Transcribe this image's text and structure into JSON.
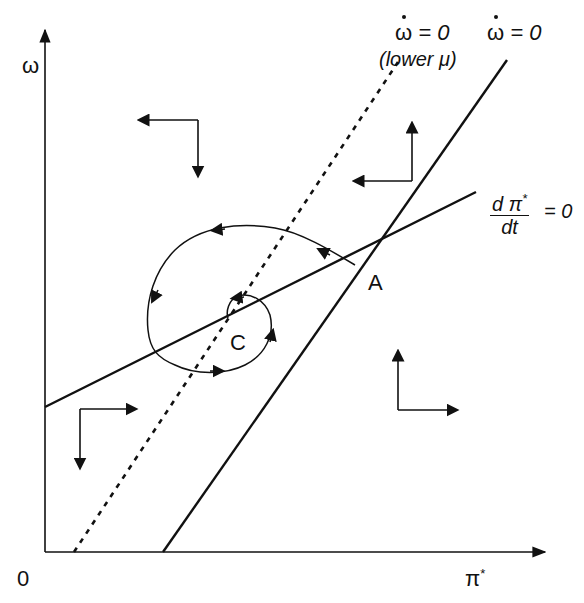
{
  "diagram": {
    "type": "phase-diagram",
    "axes": {
      "y_label": "ω",
      "x_label": "π",
      "x_label_sup": "*",
      "origin_label": "0"
    },
    "curves": {
      "omega_dot_zero": {
        "label_symbol": "ω",
        "label_rest": " = 0",
        "style": "solid"
      },
      "omega_dot_zero_lower_mu": {
        "label_symbol": "ω",
        "label_rest": " = 0",
        "sublabel": "(lower μ)",
        "style": "dashed"
      },
      "dpi_dt_zero": {
        "numerator": "d π",
        "numerator_sup": "*",
        "denominator": "dt",
        "rest": "= 0",
        "style": "solid"
      }
    },
    "points": {
      "A": "A",
      "C": "C"
    },
    "direction_arrows": [
      {
        "region": "upper-left",
        "horizontal": "left",
        "vertical": "down"
      },
      {
        "region": "upper-right",
        "horizontal": "left",
        "vertical": "up"
      },
      {
        "region": "lower-left",
        "horizontal": "right",
        "vertical": "down"
      },
      {
        "region": "lower-right",
        "horizontal": "right",
        "vertical": "up"
      }
    ],
    "trajectory": "spiral from A counter-clockwise converging to C",
    "colors": {
      "ink": "#111111",
      "background": "#ffffff"
    }
  }
}
